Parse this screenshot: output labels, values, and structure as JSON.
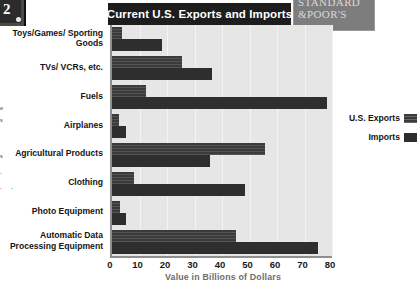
{
  "header": {
    "title": "Current U.S. Exports and Imports",
    "logo_line1": "STANDARD",
    "logo_line2": "&POOR'S",
    "page_number": "2"
  },
  "legend": {
    "position": "right",
    "items": [
      {
        "label": "U.S. Exports",
        "swatch": "exports-swatch",
        "color": "#3b3b3b"
      },
      {
        "label": "Imports",
        "swatch": "imports-swatch",
        "color": "#2e2e2e"
      }
    ]
  },
  "axis": {
    "x_title": "Value in Billions of Dollars",
    "x_ticks": [
      "0",
      "10",
      "20",
      "30",
      "40",
      "50",
      "60",
      "70",
      "80"
    ]
  },
  "chart_data": {
    "type": "bar",
    "orientation": "horizontal",
    "title": "Current U.S. Exports and Imports",
    "xlabel": "Value in Billions of Dollars",
    "ylabel": "",
    "xlim": [
      0,
      80
    ],
    "xticks": [
      0,
      10,
      20,
      30,
      40,
      50,
      60,
      70,
      80
    ],
    "grid": true,
    "legend": "right",
    "categories": [
      "Toys/Games/ Sporting Goods",
      "TVs/ VCRs, etc.",
      "Fuels",
      "Airplanes",
      "Agricultural Products",
      "Clothing",
      "Photo Equipment",
      "Automatic Data Processing Equipment"
    ],
    "series": [
      {
        "name": "U.S. Exports",
        "color": "#3b3b3b",
        "values": [
          3.5,
          25.5,
          12.5,
          2.5,
          55.5,
          8,
          3,
          45
        ]
      },
      {
        "name": "Imports",
        "color": "#2e2e2e",
        "values": [
          18,
          36.5,
          78,
          5,
          35.5,
          48.5,
          5,
          75
        ]
      }
    ]
  }
}
